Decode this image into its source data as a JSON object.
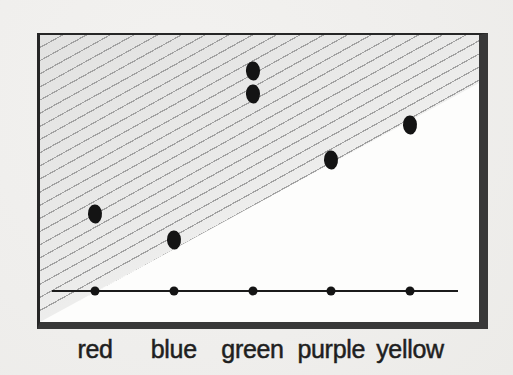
{
  "figure": {
    "colors": {
      "page_background": "#efeeec",
      "plot_background": "#fdfdfc",
      "border_dark": "#262626",
      "border_shadow": "#383838",
      "hatch_line": "#a2a2a2",
      "hatch_fill": "#e2e2e1",
      "point_color": "#141414",
      "label_color": "#1f1f1f"
    }
  },
  "chart_data": {
    "type": "scatter",
    "title": "",
    "xlabel": "",
    "ylabel": "",
    "categories": [
      "red",
      "blue",
      "green",
      "purple",
      "yellow"
    ],
    "series": [
      {
        "name": "elevated-points",
        "marker": "large-ellipse",
        "points": [
          {
            "category": "red",
            "value": 0.3
          },
          {
            "category": "blue",
            "value": 0.2
          },
          {
            "category": "green",
            "value": 0.86
          },
          {
            "category": "green",
            "value": 0.77
          },
          {
            "category": "purple",
            "value": 0.51
          },
          {
            "category": "yellow",
            "value": 0.65
          }
        ]
      },
      {
        "name": "baseline-points",
        "marker": "small-dot",
        "points": [
          {
            "category": "red",
            "value": 0
          },
          {
            "category": "blue",
            "value": 0
          },
          {
            "category": "green",
            "value": 0
          },
          {
            "category": "purple",
            "value": 0
          },
          {
            "category": "yellow",
            "value": 0
          }
        ]
      }
    ],
    "ylim": [
      0,
      1
    ],
    "grid": false,
    "legend": false,
    "annotations": [
      "upper-left triangular region filled with diagonal hatching, boundary from bottom-left corner to near top-right corner",
      "horizontal baseline near bottom with one small dot per category",
      "plot box drawn with heavy shadow border on right and bottom edges"
    ]
  }
}
